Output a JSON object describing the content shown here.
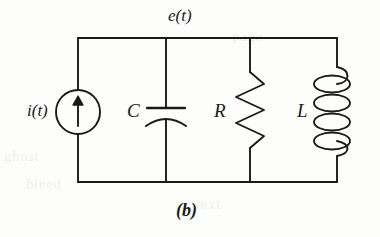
{
  "figure": {
    "caption": "(b)",
    "type": "parallel RLC circuit with current source",
    "background_color": "#fdfdfc",
    "line_color": "#1a1a1a"
  },
  "labels": {
    "node_voltage": "e(t)",
    "source": "i(t)",
    "capacitor": "C",
    "resistor": "R",
    "inductor": "L"
  },
  "ghost_text": {
    "line1": "ghost",
    "line2": "bleed",
    "line3": "page",
    "line4": "text"
  },
  "components": {
    "current_source": {
      "name": "current-source",
      "symbol": "circle-with-up-arrow",
      "arrow_direction": "up"
    },
    "capacitor": {
      "name": "capacitor",
      "symbol": "curved-plate-capacitor",
      "plates": 2
    },
    "resistor": {
      "name": "resistor",
      "symbol": "zigzag",
      "zigzag_peaks": 6
    },
    "inductor": {
      "name": "inductor",
      "symbol": "coil",
      "loops": 4
    }
  }
}
